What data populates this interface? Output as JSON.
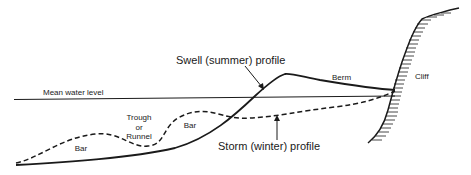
{
  "diagram": {
    "type": "beach-profile-cross-section",
    "labels": {
      "mean_water_level": "Mean water level",
      "swell_profile": "Swell (summer) profile",
      "storm_profile": "Storm (winter) profile",
      "berm": "Berm",
      "cliff": "Cliff",
      "trough_line1": "Trough",
      "trough_line2": "or",
      "trough_line3": "Runnel",
      "bar_offshore": "Bar",
      "bar_nearshore": "Bar"
    },
    "colors": {
      "ink": "#1a1a1a",
      "background": "#ffffff"
    },
    "legend": [
      {
        "name": "Swell (summer) profile",
        "style": "solid"
      },
      {
        "name": "Storm (winter) profile",
        "style": "dashed"
      }
    ]
  }
}
